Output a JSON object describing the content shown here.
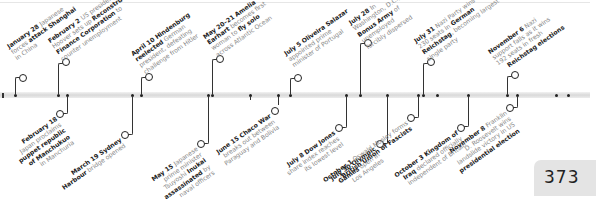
{
  "page_number": "373",
  "top_events": [
    {
      "date": "January 28",
      "parts": [
        {
          "t": " Japanese forces ",
          "b": false
        },
        {
          "t": "attack Shanghai",
          "b": true
        },
        {
          "t": " in China",
          "b": false
        }
      ],
      "lines": [
        "January 28 Japanese",
        "forces attack Shanghai",
        "in China"
      ]
    },
    {
      "date": "February 2",
      "lines": [
        "February 2 US president",
        "Hoover sets up Reconstruction",
        "Finance Corporation to",
        "counter unemployment"
      ]
    },
    {
      "date": "April 10",
      "lines": [
        "April 10 Hindenburg",
        "reelected German",
        "president, defeating",
        "challenge from Hitler"
      ]
    },
    {
      "date": "May 20–21",
      "lines": [
        "May 20–21 Amelia",
        "Earhart becomes first",
        "woman to fly solo",
        "across Atlantic Ocean"
      ]
    },
    {
      "date": "July 5",
      "lines": [
        "July 5 Oliveira Salazar",
        "appointed prime",
        "minister of Portugal"
      ]
    },
    {
      "date": "July 28",
      "lines": [
        "July 28 In",
        "Washington, D.C.,",
        "Bonus Army of",
        "unemployed",
        "forcibly dispersed"
      ]
    },
    {
      "date": "July 31",
      "lines": [
        "July 31 Nazi Party wins",
        "230 seats in German",
        "Reichstag, becoming largest",
        "single party"
      ]
    },
    {
      "date": "November 6",
      "lines": [
        "November 6 Nazi",
        "support falls as it wins",
        "192 seats in fresh",
        "Reichstag elections"
      ]
    }
  ],
  "bottom_events": [
    {
      "date": "February 18",
      "lines": [
        "February 18",
        "Japan proclaims",
        "puppet republic",
        "of Manchukuo",
        "in Manchuria"
      ]
    },
    {
      "date": "March 19",
      "lines": [
        "March 19 Sydney",
        "Harbour bridge opened"
      ]
    },
    {
      "date": "May 15",
      "lines": [
        "May 15 Japanese",
        "prime minister",
        "Tsuyoshi Inukai",
        "assassinated by",
        "naval officers"
      ]
    },
    {
      "date": "June 15",
      "lines": [
        "June 15 Chaco War",
        "breaks out between",
        "Paraguay and Bolivia"
      ]
    },
    {
      "date": "July 8",
      "lines": [
        "July 8 Dow Jones",
        "share index reaches",
        "its lowest level"
      ]
    },
    {
      "date": "July 30",
      "lines": [
        "July 30 Olympic",
        "Games open in",
        "Los Angeles"
      ]
    },
    {
      "date": "October 1",
      "lines": [
        "October 1 Oswald Mosley forms",
        "British Union of Fascists"
      ]
    },
    {
      "date": "October 3",
      "lines": [
        "October 3 Kingdom of",
        "Iraq declared officially",
        "independent of Britain"
      ]
    },
    {
      "date": "November 8",
      "lines": [
        "November 8 Franklin",
        "D. Roosevelt wins",
        "landslide victory in US",
        "presidential election"
      ]
    }
  ],
  "extra_ticks_x": [
    3,
    66,
    131,
    208,
    249,
    346,
    387,
    418,
    468,
    516
  ]
}
